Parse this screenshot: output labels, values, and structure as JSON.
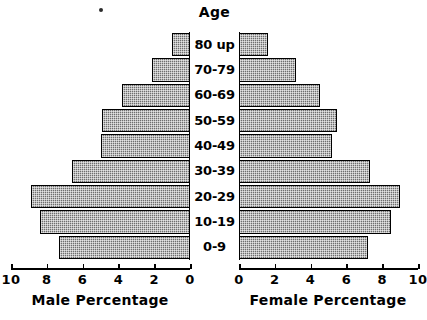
{
  "chart_data": {
    "type": "bar",
    "subtype": "population-pyramid",
    "title": "",
    "age_axis_title": "Age",
    "categories": [
      "0-9",
      "10-19",
      "20-29",
      "30-39",
      "40-49",
      "50-59",
      "60-69",
      "70-79",
      "80 up"
    ],
    "categories_top_to_bottom": [
      "80 up",
      "70-79",
      "60-69",
      "50-59",
      "40-49",
      "30-39",
      "20-29",
      "10-19",
      "0-9"
    ],
    "series": [
      {
        "name": "Male Percentage",
        "side": "left",
        "xlabel": "Male Percentage",
        "axis_direction": "reversed",
        "ticks": [
          10,
          8,
          6,
          4,
          2,
          0
        ],
        "tick_labels": [
          "10",
          "8",
          "6",
          "4",
          "2",
          "0"
        ],
        "xlim": [
          0,
          10
        ],
        "values_top_to_bottom": [
          1.0,
          2.1,
          3.8,
          4.9,
          5.0,
          6.6,
          8.9,
          8.4,
          7.3
        ],
        "values": [
          7.3,
          8.4,
          8.9,
          6.6,
          5.0,
          4.9,
          3.8,
          2.1,
          1.0
        ]
      },
      {
        "name": "Female Percentage",
        "side": "right",
        "xlabel": "Female Percentage",
        "axis_direction": "normal",
        "ticks": [
          0,
          2,
          4,
          6,
          8,
          10
        ],
        "tick_labels": [
          "0",
          "2",
          "4",
          "6",
          "8",
          "10"
        ],
        "xlim": [
          0,
          10
        ],
        "values_top_to_bottom": [
          1.6,
          3.2,
          4.5,
          5.5,
          5.2,
          7.3,
          9.0,
          8.5,
          7.2
        ],
        "values": [
          7.2,
          8.5,
          9.0,
          7.3,
          5.2,
          5.5,
          4.5,
          3.2,
          1.6
        ]
      }
    ],
    "grid": false,
    "legend": "none",
    "bar_fill": "#6e6e6e",
    "bar_border": "#000000",
    "background": "#ffffff"
  }
}
